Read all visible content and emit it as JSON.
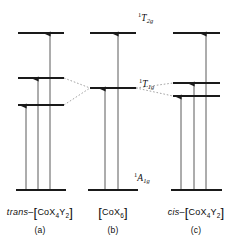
{
  "figure": {
    "background_color": "#ffffff",
    "line_color": "#1a1a1a",
    "correlation_line_color": "#9a9a9a",
    "arrow_color": "#5a5a5a",
    "width": 244,
    "height": 242
  },
  "term_labels": [
    {
      "name": "t2g",
      "pre": "1",
      "letter": "T",
      "sub": "2g",
      "x": 138,
      "y": 12
    },
    {
      "name": "t1g",
      "pre": "1",
      "letter": "T",
      "sub": "1g",
      "x": 139,
      "y": 78
    },
    {
      "name": "a1g",
      "pre": "1",
      "letter": "A",
      "sub": "1g",
      "x": 134,
      "y": 172
    }
  ],
  "panels": [
    {
      "id": "trans",
      "caption": "(a)",
      "caption_x": 40,
      "caption_y": 226,
      "label_x": 40,
      "label_y": 206,
      "formula": {
        "italic_prefix": "trans",
        "dash": "–",
        "bracket_open": "[",
        "metal": "CoX",
        "sub1": "4",
        "ligand": "Y",
        "sub2": "2",
        "bracket_close": "]"
      },
      "levels": [
        {
          "name": "upper-level",
          "x1": 18,
          "x2": 64,
          "y": 33
        },
        {
          "name": "middle-level",
          "x1": 18,
          "x2": 64,
          "y": 78
        },
        {
          "name": "lower-level",
          "x1": 18,
          "x2": 64,
          "y": 105
        },
        {
          "name": "ground-level",
          "x1": 16,
          "x2": 66,
          "y": 190
        }
      ],
      "transitions": [
        {
          "name": "transition-1",
          "x": 26,
          "y_from": 190,
          "y_to": 105
        },
        {
          "name": "transition-2",
          "x": 38,
          "y_from": 190,
          "y_to": 78
        },
        {
          "name": "transition-3",
          "x": 50,
          "y_from": 190,
          "y_to": 33
        }
      ]
    },
    {
      "id": "oh",
      "caption": "(b)",
      "caption_x": 113,
      "caption_y": 226,
      "label_x": 113,
      "label_y": 206,
      "formula": {
        "italic_prefix": "",
        "dash": "",
        "bracket_open": "[",
        "metal": "CoX",
        "sub1": "6",
        "ligand": "",
        "sub2": "",
        "bracket_close": "]"
      },
      "levels": [
        {
          "name": "upper-level",
          "x1": 90,
          "x2": 136,
          "y": 33
        },
        {
          "name": "middle-level",
          "x1": 90,
          "x2": 136,
          "y": 88
        },
        {
          "name": "ground-level",
          "x1": 88,
          "x2": 138,
          "y": 190
        }
      ],
      "transitions": [
        {
          "name": "transition-1",
          "x": 105,
          "y_from": 190,
          "y_to": 88
        },
        {
          "name": "transition-2",
          "x": 118,
          "y_from": 190,
          "y_to": 33
        }
      ]
    },
    {
      "id": "cis",
      "caption": "(c)",
      "caption_x": 196,
      "caption_y": 226,
      "label_x": 196,
      "label_y": 206,
      "formula": {
        "italic_prefix": "cis",
        "dash": "–",
        "bracket_open": "[",
        "metal": "CoX",
        "sub1": "4",
        "ligand": "Y",
        "sub2": "2",
        "bracket_close": "]"
      },
      "levels": [
        {
          "name": "upper-level",
          "x1": 173,
          "x2": 220,
          "y": 33
        },
        {
          "name": "middle-level",
          "x1": 173,
          "x2": 220,
          "y": 83
        },
        {
          "name": "lower-level",
          "x1": 173,
          "x2": 220,
          "y": 96
        },
        {
          "name": "ground-level",
          "x1": 171,
          "x2": 222,
          "y": 190
        }
      ],
      "transitions": [
        {
          "name": "transition-1",
          "x": 181,
          "y_from": 190,
          "y_to": 96
        },
        {
          "name": "transition-2",
          "x": 194,
          "y_from": 190,
          "y_to": 83
        },
        {
          "name": "transition-3",
          "x": 206,
          "y_from": 190,
          "y_to": 33
        }
      ]
    }
  ],
  "correlation_lines": [
    {
      "name": "corr-trans-upper",
      "x1": 64,
      "y1": 78,
      "x2": 90,
      "y2": 88
    },
    {
      "name": "corr-trans-lower",
      "x1": 64,
      "y1": 105,
      "x2": 90,
      "y2": 88
    },
    {
      "name": "corr-cis-upper",
      "x1": 136,
      "y1": 88,
      "x2": 173,
      "y2": 83
    },
    {
      "name": "corr-cis-lower",
      "x1": 136,
      "y1": 88,
      "x2": 173,
      "y2": 96
    }
  ]
}
